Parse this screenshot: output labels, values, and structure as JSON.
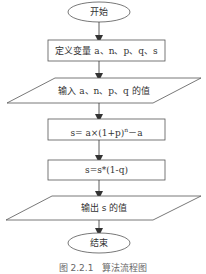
{
  "flowchart": {
    "nodes": [
      {
        "id": "start",
        "shape": "terminal",
        "label": "开始"
      },
      {
        "id": "define",
        "shape": "process",
        "label": "定义变量 a、n、p、q、s"
      },
      {
        "id": "input",
        "shape": "io",
        "label": "输入 a、n、p、q 的值"
      },
      {
        "id": "calc1",
        "shape": "process",
        "label_prefix": "s= a×(1+p)",
        "label_sup": "n",
        "label_suffix": "－a"
      },
      {
        "id": "calc2",
        "shape": "process",
        "label": "s=s*(1-q)"
      },
      {
        "id": "output",
        "shape": "io",
        "label": "输出 s 的值"
      },
      {
        "id": "end",
        "shape": "terminal",
        "label": "结束"
      }
    ],
    "edges": [
      [
        "start",
        "define"
      ],
      [
        "define",
        "input"
      ],
      [
        "input",
        "calc1"
      ],
      [
        "calc1",
        "calc2"
      ],
      [
        "calc2",
        "output"
      ],
      [
        "output",
        "end"
      ]
    ]
  },
  "caption": "图 2.2.1　算法流程图",
  "colors": {
    "stroke": "#555555",
    "text": "#333333",
    "background": "#ffffff"
  }
}
